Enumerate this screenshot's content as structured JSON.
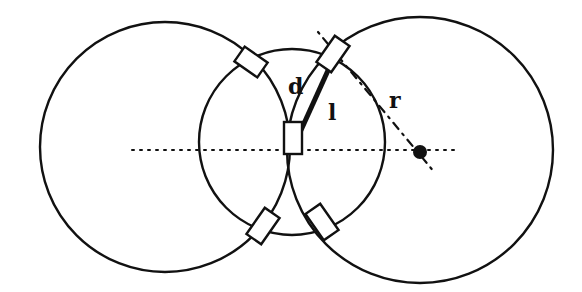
{
  "diagram": {
    "labels": {
      "d": "d",
      "l": "l",
      "r": "r"
    },
    "colors": {
      "stroke": "#111111",
      "background": "#ffffff"
    }
  }
}
